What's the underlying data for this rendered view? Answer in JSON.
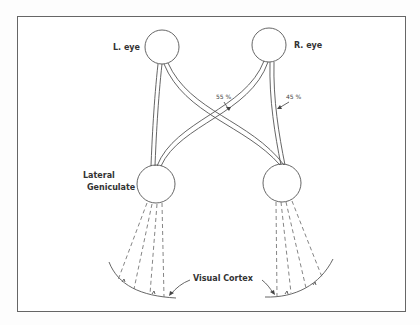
{
  "diagram": {
    "labels": {
      "left_eye": "L. eye",
      "right_eye": "R. eye",
      "lateral_geniculate_line1": "Lateral",
      "lateral_geniculate_line2": "Geniculate",
      "visual_cortex": "Visual Cortex",
      "crossed_percent": "55 %",
      "uncrossed_percent": "45 %"
    },
    "colors": {
      "line": "#555555",
      "text": "#333333",
      "background": "#fdfdfd",
      "frame": "#666666"
    }
  }
}
